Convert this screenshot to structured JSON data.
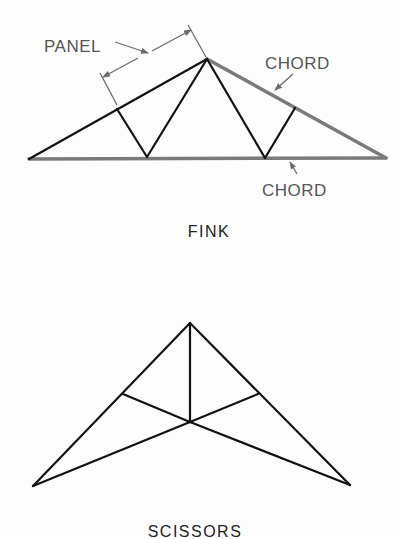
{
  "figure": {
    "colors": {
      "member": "#111111",
      "chord": "#7a7a7a",
      "annotation": "#6a6a6a",
      "text_label": "#555555",
      "text_caption": "#222222",
      "background": "#fdfdfd"
    }
  },
  "fink": {
    "caption": "FINK",
    "labels": {
      "panel": "PANEL",
      "top_chord": "CHORD",
      "bottom_chord": "CHORD"
    },
    "nodes": {
      "left_support": [
        29,
        159
      ],
      "right_support": [
        386,
        158
      ],
      "apex": [
        207,
        59
      ],
      "left_top_panel_point": [
        117,
        109
      ],
      "right_top_panel_point": [
        295,
        108
      ],
      "left_bottom_node": [
        147,
        157
      ],
      "right_bottom_node": [
        265,
        158
      ]
    }
  },
  "scissors": {
    "caption": "SCISSORS",
    "nodes": {
      "left_support": [
        33,
        486
      ],
      "right_support": [
        350,
        485
      ],
      "apex": [
        190,
        323
      ],
      "center_node": [
        190,
        422
      ],
      "left_top_node": [
        123,
        394
      ],
      "right_top_node": [
        258,
        394
      ]
    }
  }
}
